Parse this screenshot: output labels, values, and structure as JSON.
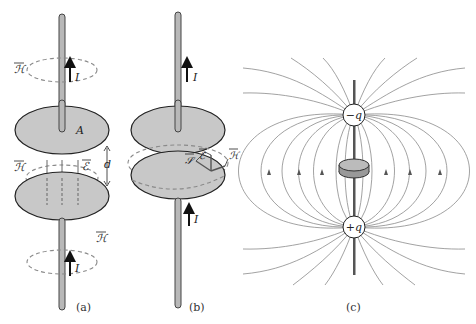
{
  "figure": {
    "panels": [
      {
        "id": "a",
        "caption": "(a)",
        "labels": {
          "current_top": "I",
          "current_bottom": "I",
          "h_field_top": "ℋ",
          "h_field_middle": "ℋ",
          "h_field_bottom": "ℋ",
          "e_field": "ℰ",
          "plate_area": "A",
          "gap": "d"
        }
      },
      {
        "id": "b",
        "caption": "(b)",
        "labels": {
          "current_top": "I",
          "current_bottom": "I",
          "poynting": "𝒮",
          "e_field": "ℰ",
          "h_field": "ℋ"
        }
      },
      {
        "id": "c",
        "caption": "(c)",
        "labels": {
          "negative_charge": "−q",
          "positive_charge": "+q"
        }
      }
    ],
    "colors": {
      "plate_fill": "#c8c8c8",
      "outline": "#222222",
      "field_line": "#8a8a8a",
      "wire_fill": "#b8b8b8"
    }
  }
}
